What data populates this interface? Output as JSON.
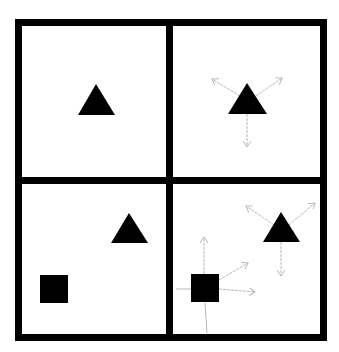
{
  "diagram": {
    "colors": {
      "background": "#ffffff",
      "frame": "#000000",
      "shape": "#000000",
      "arrow": "#b8b8b8"
    },
    "panels": [
      {
        "id": "top-left",
        "shapes": [
          {
            "type": "triangle",
            "points": "96,84 78,115 115,115"
          }
        ],
        "arrows": []
      },
      {
        "id": "top-right",
        "shapes": [
          {
            "type": "triangle",
            "points": "247,83 228,114 267,114"
          }
        ],
        "arrows": [
          {
            "from": [
              240,
              96
            ],
            "to": [
              212,
              79
            ]
          },
          {
            "from": [
              256,
              96
            ],
            "to": [
              282,
              78
            ]
          },
          {
            "from": [
              247,
              114
            ],
            "to": [
              247,
              147
            ]
          }
        ]
      },
      {
        "id": "bottom-left",
        "shapes": [
          {
            "type": "triangle",
            "points": "129,213 111,243 148,243"
          },
          {
            "type": "square",
            "x": 40,
            "y": 275,
            "size": 28
          }
        ],
        "arrows": []
      },
      {
        "id": "bottom-right",
        "shapes": [
          {
            "type": "triangle",
            "points": "281,212 263,242 300,242"
          },
          {
            "type": "square",
            "x": 191,
            "y": 274,
            "size": 28
          }
        ],
        "arrows": [
          {
            "from": [
              274,
              225
            ],
            "to": [
              246,
              206
            ]
          },
          {
            "from": [
              289,
              225
            ],
            "to": [
              315,
              203
            ]
          },
          {
            "from": [
              281,
              242
            ],
            "to": [
              281,
              276
            ]
          },
          {
            "from": [
              204,
              274
            ],
            "to": [
              204,
              237
            ]
          },
          {
            "from": [
              219,
              280
            ],
            "to": [
              248,
              263
            ]
          },
          {
            "from": [
              219,
              289
            ],
            "to": [
              255,
              292
            ]
          }
        ],
        "lines": [
          {
            "from": [
              176,
              289
            ],
            "to": [
              191,
              289
            ]
          },
          {
            "from": [
              205,
              303
            ],
            "to": [
              207,
              333
            ]
          }
        ]
      }
    ]
  }
}
